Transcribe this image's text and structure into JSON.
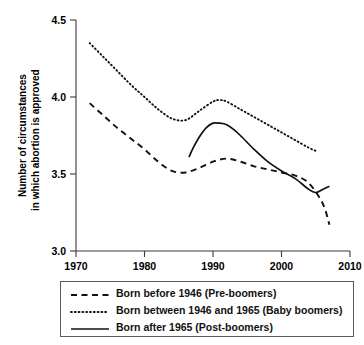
{
  "chart_data": {
    "type": "line",
    "title": "",
    "xlabel": "",
    "ylabel": "Number of circumstances\nin which abortion is approved",
    "ylabel_line1": "Number of circumstances",
    "ylabel_line2": "in which abortion is approved",
    "xlim": [
      1970,
      2010
    ],
    "ylim": [
      3.0,
      4.5
    ],
    "xticks": [
      1970,
      1980,
      1990,
      2000,
      2010
    ],
    "xtick_labels": [
      "1970",
      "1980",
      "1990",
      "2000",
      "2010"
    ],
    "yticks": [
      3.0,
      3.5,
      4.0,
      4.5
    ],
    "ytick_labels": [
      "3.0",
      "3.5",
      "4.0",
      "4.5"
    ],
    "grid": false,
    "legend_position": "below-plot",
    "line_color": "#111111",
    "series": [
      {
        "name": "Born before 1946 (Pre-boomers)",
        "style": "dashed",
        "x": [
          1972,
          1974,
          1976,
          1978,
          1980,
          1982,
          1984,
          1986,
          1988,
          1990,
          1992,
          1994,
          1996,
          1998,
          2000,
          2002,
          2004,
          2006,
          2007
        ],
        "y": [
          3.96,
          3.88,
          3.8,
          3.73,
          3.66,
          3.58,
          3.52,
          3.51,
          3.54,
          3.58,
          3.6,
          3.58,
          3.55,
          3.53,
          3.51,
          3.49,
          3.44,
          3.31,
          3.17
        ]
      },
      {
        "name": "Born between 1946 and 1965 (Baby boomers)",
        "style": "dotted",
        "x": [
          1972,
          1974,
          1976,
          1978,
          1980,
          1982,
          1984,
          1986,
          1988,
          1990,
          1991,
          1992,
          1994,
          1996,
          1998,
          2000,
          2002,
          2004,
          2005
        ],
        "y": [
          4.35,
          4.26,
          4.17,
          4.08,
          4.0,
          3.92,
          3.86,
          3.85,
          3.91,
          3.97,
          3.98,
          3.97,
          3.92,
          3.87,
          3.82,
          3.77,
          3.72,
          3.67,
          3.65
        ]
      },
      {
        "name": "Born after 1965 (Post-boomers)",
        "style": "solid",
        "x": [
          1986.5,
          1987,
          1988,
          1989,
          1990,
          1991,
          1992,
          1993,
          1994,
          1996,
          1998,
          2000,
          2002,
          2004,
          2005,
          2006,
          2007
        ],
        "y": [
          3.61,
          3.66,
          3.74,
          3.8,
          3.83,
          3.83,
          3.82,
          3.79,
          3.75,
          3.66,
          3.58,
          3.52,
          3.47,
          3.4,
          3.38,
          3.4,
          3.42
        ]
      }
    ]
  },
  "legend": {
    "items": [
      {
        "label": "Born before 1946 (Pre-boomers)",
        "style": "dashed"
      },
      {
        "label": "Born between 1946 and 1965 (Baby boomers)",
        "style": "dotted"
      },
      {
        "label": "Born after 1965 (Post-boomers)",
        "style": "solid"
      }
    ]
  }
}
